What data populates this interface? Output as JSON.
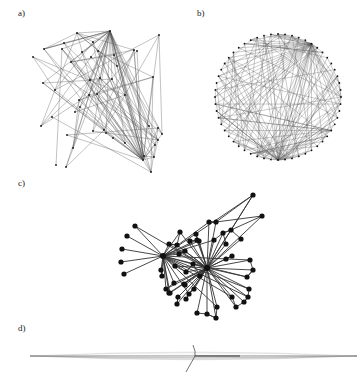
{
  "figure": {
    "panels": [
      {
        "id": "a",
        "label": "a)",
        "label_pos": [
          18,
          15
        ],
        "layout": "random"
      },
      {
        "id": "b",
        "label": "b)",
        "label_pos": [
          197,
          15
        ],
        "layout": "circular"
      },
      {
        "id": "c",
        "label": "c)",
        "label_pos": [
          18,
          186
        ],
        "layout": "force-directed"
      },
      {
        "id": "d",
        "label": "d)",
        "label_pos": [
          18,
          330
        ],
        "layout": "linear"
      }
    ]
  },
  "colors": {
    "edge_light": "#555555",
    "edge_dark": "#333333",
    "node": "#111111",
    "background": "#ffffff"
  },
  "panel_a": {
    "nodes": [
      [
        110,
        31
      ],
      [
        77,
        33
      ],
      [
        159,
        35
      ],
      [
        93,
        42
      ],
      [
        64,
        43
      ],
      [
        98,
        51
      ],
      [
        62,
        49
      ],
      [
        44,
        49
      ],
      [
        134,
        50
      ],
      [
        137,
        51
      ],
      [
        82,
        52
      ],
      [
        114,
        55
      ],
      [
        33,
        57
      ],
      [
        91,
        57
      ],
      [
        71,
        62
      ],
      [
        117,
        66
      ],
      [
        43,
        83
      ],
      [
        55,
        90
      ],
      [
        90,
        80
      ],
      [
        153,
        77
      ],
      [
        112,
        79
      ],
      [
        100,
        78
      ],
      [
        89,
        95
      ],
      [
        125,
        95
      ],
      [
        79,
        100
      ],
      [
        97,
        94
      ],
      [
        80,
        107
      ],
      [
        52,
        117
      ],
      [
        41,
        126
      ],
      [
        149,
        126
      ],
      [
        67,
        135
      ],
      [
        104,
        130
      ],
      [
        93,
        131
      ],
      [
        75,
        112
      ],
      [
        158,
        128
      ],
      [
        162,
        134
      ],
      [
        144,
        156
      ],
      [
        154,
        157
      ],
      [
        155,
        145
      ],
      [
        143,
        160
      ],
      [
        56,
        165
      ],
      [
        66,
        167
      ],
      [
        151,
        172
      ],
      [
        158,
        140
      ],
      [
        113,
        138
      ],
      [
        106,
        133
      ],
      [
        73,
        148
      ],
      [
        125,
        143
      ]
    ],
    "hubs": [
      0,
      39
    ]
  },
  "panel_b": {
    "center": [
      278,
      97
    ],
    "radius": 63,
    "node_count": 56,
    "hub_angles": [
      90,
      -55
    ]
  },
  "panel_c": {
    "nodes": [
      [
        163,
        256
      ],
      [
        207,
        268
      ],
      [
        253,
        195
      ],
      [
        262,
        216
      ],
      [
        135,
        226
      ],
      [
        127,
        236
      ],
      [
        122,
        249
      ],
      [
        121,
        262
      ],
      [
        124,
        274
      ],
      [
        231,
        230
      ],
      [
        209,
        222
      ],
      [
        216,
        222
      ],
      [
        223,
        233
      ],
      [
        196,
        234
      ],
      [
        180,
        232
      ],
      [
        169,
        244
      ],
      [
        177,
        245
      ],
      [
        190,
        241
      ],
      [
        199,
        241
      ],
      [
        179,
        254
      ],
      [
        185,
        251
      ],
      [
        197,
        240
      ],
      [
        226,
        244
      ],
      [
        241,
        239
      ],
      [
        232,
        256
      ],
      [
        250,
        260
      ],
      [
        253,
        270
      ],
      [
        247,
        277
      ],
      [
        249,
        289
      ],
      [
        232,
        297
      ],
      [
        248,
        297
      ],
      [
        244,
        302
      ],
      [
        236,
        307
      ],
      [
        162,
        276
      ],
      [
        166,
        289
      ],
      [
        169,
        293
      ],
      [
        174,
        283
      ],
      [
        185,
        285
      ],
      [
        189,
        294
      ],
      [
        177,
        304
      ],
      [
        170,
        293
      ],
      [
        178,
        297
      ],
      [
        184,
        284
      ],
      [
        194,
        289
      ],
      [
        197,
        313
      ],
      [
        207,
        314
      ],
      [
        217,
        307
      ],
      [
        216,
        318
      ],
      [
        186,
        299
      ],
      [
        214,
        240
      ],
      [
        193,
        264
      ],
      [
        175,
        266
      ],
      [
        186,
        272
      ],
      [
        200,
        276
      ],
      [
        226,
        259
      ],
      [
        161,
        270
      ]
    ],
    "hubs": [
      0,
      1
    ]
  },
  "panel_d": {
    "axis_y": 356,
    "x_start": 30,
    "x_end": 357,
    "crossing_x": 195,
    "spur_end": [
      186,
      372
    ],
    "spur_top": [
      193,
      345
    ]
  }
}
